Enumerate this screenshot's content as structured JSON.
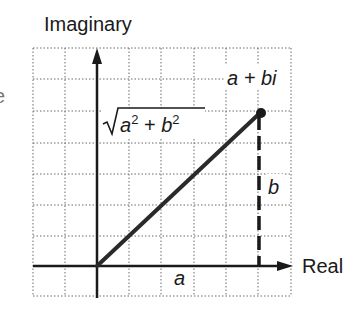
{
  "labels": {
    "imaginary_axis": "Imaginary",
    "real_axis": "Real",
    "point": "a + bi",
    "magnitude_a": "a",
    "magnitude_plus": " + ",
    "magnitude_b": "b",
    "magnitude_exp": "2",
    "horizontal_leg": "a",
    "vertical_leg": "b",
    "left_fragment": "e"
  },
  "colors": {
    "ink": "#1a1a1a",
    "grid": "#6a6a6a",
    "background": "#ffffff"
  },
  "grid": {
    "x_lines": [
      33,
      65,
      97,
      129,
      161,
      194,
      226,
      258,
      291
    ],
    "y_lines": [
      48,
      79,
      111,
      143,
      174,
      205,
      236,
      266,
      296
    ]
  },
  "geometry": {
    "origin": [
      97,
      266
    ],
    "point": [
      261,
      112
    ]
  }
}
